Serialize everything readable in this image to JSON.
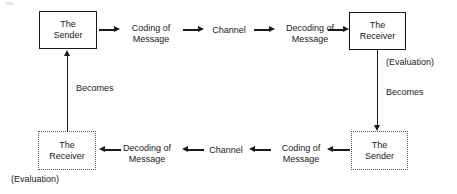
{
  "diagram": {
    "nodes": {
      "top_sender": {
        "line1": "The",
        "line2": "Sender",
        "border": "solid"
      },
      "top_receiver": {
        "line1": "The",
        "line2": "Receiver",
        "border": "solid"
      },
      "bottom_sender": {
        "line1": "The",
        "line2": "Sender",
        "border": "dotted"
      },
      "bottom_receiver": {
        "line1": "The",
        "line2": "Receiver",
        "border": "dotted"
      }
    },
    "top_row_labels": {
      "coding_line1": "Coding of",
      "coding_line2": "Message",
      "channel": "Channel",
      "decoding_line1": "Decoding of",
      "decoding_line2": "Message"
    },
    "bottom_row_labels": {
      "coding_line1": "Coding of",
      "coding_line2": "Message",
      "channel": "Channel",
      "decoding_line1": "Decoding of",
      "decoding_line2": "Message"
    },
    "annotations": {
      "evaluation_right": "(Evaluation)",
      "evaluation_left": "(Evaluation)",
      "becomes_right": "Becomes",
      "becomes_left": "Becomes"
    },
    "colors": {
      "stroke": "#1a1a1a",
      "dotted_stroke": "#555555",
      "background": "#ffffff"
    }
  }
}
